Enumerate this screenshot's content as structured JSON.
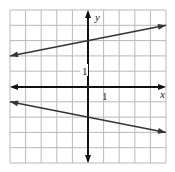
{
  "chart_data": {
    "type": "line",
    "title": "",
    "xlabel": "x",
    "ylabel": "y",
    "xlim": [
      -5,
      5
    ],
    "ylim": [
      -5,
      5
    ],
    "grid": true,
    "tick_labels": {
      "x": "1",
      "y": "1"
    },
    "series": [
      {
        "name": "upper line",
        "equation": "y = x/5 + 3",
        "x": [
          -5,
          0,
          5
        ],
        "y": [
          2,
          3,
          4
        ]
      },
      {
        "name": "lower line",
        "equation": "y = -x/5 - 2",
        "x": [
          -5,
          0,
          5
        ],
        "y": [
          -1,
          -2,
          -3
        ]
      }
    ]
  },
  "labels": {
    "x_axis": "x",
    "y_axis": "y",
    "x_tick": "1",
    "y_tick": "1"
  }
}
